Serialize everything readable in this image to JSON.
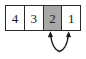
{
  "figure": {
    "background_color": "#ffffff"
  },
  "array": {
    "name": "array-cells",
    "cell_count": 4,
    "border_color": "#2b2b2b",
    "cell_fill": "#ffffff",
    "highlight_fill": "#a8a8a8",
    "text_color": "#1a1a1a",
    "cells": [
      {
        "value": "4",
        "highlighted": false
      },
      {
        "value": "3",
        "highlighted": false
      },
      {
        "value": "2",
        "highlighted": true
      },
      {
        "value": "1",
        "highlighted": false
      }
    ]
  },
  "annotation": {
    "name": "swap-arrow",
    "kind": "double-headed-curved-arrow",
    "stroke_color": "#1a1a1a",
    "points_to_cell_indices": [
      2,
      3
    ],
    "description": "curved double arrow pointing up into cells 2 and 1"
  }
}
